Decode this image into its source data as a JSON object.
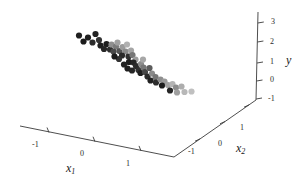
{
  "figure": {
    "kind": "3d-scatter-plot",
    "background_color": "#ffffff",
    "axis_color": "#3a3a3a",
    "width": 306,
    "height": 182
  },
  "axes": {
    "x1": {
      "title": "x",
      "subscript": "1",
      "ticks": [
        "-1",
        "0",
        "1"
      ],
      "range": [
        -2,
        2
      ]
    },
    "x2": {
      "title": "x",
      "subscript": "2",
      "ticks": [
        "-1",
        "0",
        "1"
      ],
      "range": [
        -2,
        2
      ]
    },
    "y": {
      "title": "y",
      "subscript": "",
      "ticks": [
        "-1",
        "0",
        "1",
        "2",
        "3"
      ],
      "range": [
        -1.5,
        3.5
      ]
    }
  },
  "chart_data": {
    "type": "scatter",
    "title": "",
    "xlabel": "x1",
    "ylabel": "y",
    "zlabel": "x2",
    "grid": false,
    "legend": null,
    "projection": "3d",
    "axis_ranges": {
      "x1": [
        -2,
        2
      ],
      "x2": [
        -2,
        2
      ],
      "y": [
        -1.5,
        3.5
      ]
    },
    "marker": {
      "shape": "circle",
      "radius_px": 3.1,
      "colors": [
        "#1a1a1a",
        "#4d4d4d",
        "#7d7d7d",
        "#a8a8a8",
        "#c4c4c4"
      ]
    },
    "points_px": [
      [
        79.0,
        35.5,
        "#1f1f1f"
      ],
      [
        88.0,
        37.5,
        "#1f1f1f"
      ],
      [
        95.5,
        34.0,
        "#232323"
      ],
      [
        83.5,
        41.5,
        "#1a1a1a"
      ],
      [
        92.5,
        42.5,
        "#2b2b2b"
      ],
      [
        99.0,
        40.0,
        "#333333"
      ],
      [
        100.5,
        45.5,
        "#1f1f1f"
      ],
      [
        106.5,
        44.0,
        "#1f1f1f"
      ],
      [
        104.0,
        49.0,
        "#262626"
      ],
      [
        110.0,
        49.5,
        "#2e2e2e"
      ],
      [
        111.5,
        44.5,
        "#8f8f8f"
      ],
      [
        116.0,
        46.5,
        "#7a7a7a"
      ],
      [
        117.5,
        42.5,
        "#a0a0a0"
      ],
      [
        113.5,
        51.5,
        "#4a4a4a"
      ],
      [
        119.5,
        51.0,
        "#555555"
      ],
      [
        122.5,
        47.0,
        "#9a9a9a"
      ],
      [
        127.0,
        44.5,
        "#b0b0b0"
      ],
      [
        125.5,
        51.5,
        "#8a8a8a"
      ],
      [
        131.0,
        50.5,
        "#a5a5a5"
      ],
      [
        122.0,
        55.5,
        "#2a2a2a"
      ],
      [
        128.5,
        56.5,
        "#2f2f2f"
      ],
      [
        132.5,
        55.0,
        "#777777"
      ],
      [
        135.5,
        59.5,
        "#9e9e9e"
      ],
      [
        129.0,
        62.0,
        "#1c1c1c"
      ],
      [
        133.5,
        62.5,
        "#242424"
      ],
      [
        136.0,
        66.0,
        "#2a2a2a"
      ],
      [
        124.0,
        64.5,
        "#212121"
      ],
      [
        127.5,
        68.5,
        "#1e1e1e"
      ],
      [
        132.0,
        70.5,
        "#252525"
      ],
      [
        138.5,
        70.0,
        "#303030"
      ],
      [
        141.0,
        64.0,
        "#8c8c8c"
      ],
      [
        143.5,
        67.5,
        "#767676"
      ],
      [
        140.5,
        73.0,
        "#1f1f1f"
      ],
      [
        145.0,
        72.0,
        "#474747"
      ],
      [
        147.5,
        76.5,
        "#2b2b2b"
      ],
      [
        152.0,
        73.5,
        "#8b8b8b"
      ],
      [
        155.5,
        77.0,
        "#777777"
      ],
      [
        150.5,
        80.5,
        "#212121"
      ],
      [
        156.0,
        82.5,
        "#2d2d2d"
      ],
      [
        160.5,
        79.5,
        "#8e8e8e"
      ],
      [
        164.5,
        81.5,
        "#9b9b9b"
      ],
      [
        162.0,
        85.5,
        "#1d1d1d"
      ],
      [
        168.0,
        85.0,
        "#a2a2a2"
      ],
      [
        172.5,
        84.0,
        "#b4b4b4"
      ],
      [
        176.0,
        87.5,
        "#8d8d8d"
      ],
      [
        181.5,
        86.5,
        "#adadad"
      ],
      [
        170.0,
        90.5,
        "#262626"
      ],
      [
        177.0,
        92.5,
        "#9f9f9f"
      ],
      [
        184.5,
        92.0,
        "#b8b8b8"
      ],
      [
        191.5,
        91.5,
        "#c0c0c0"
      ],
      [
        119.0,
        59.0,
        "#333333"
      ],
      [
        114.5,
        56.5,
        "#1b1b1b"
      ],
      [
        143.0,
        59.5,
        "#a7a7a7"
      ],
      [
        149.5,
        68.0,
        "#5c5c5c"
      ]
    ]
  }
}
